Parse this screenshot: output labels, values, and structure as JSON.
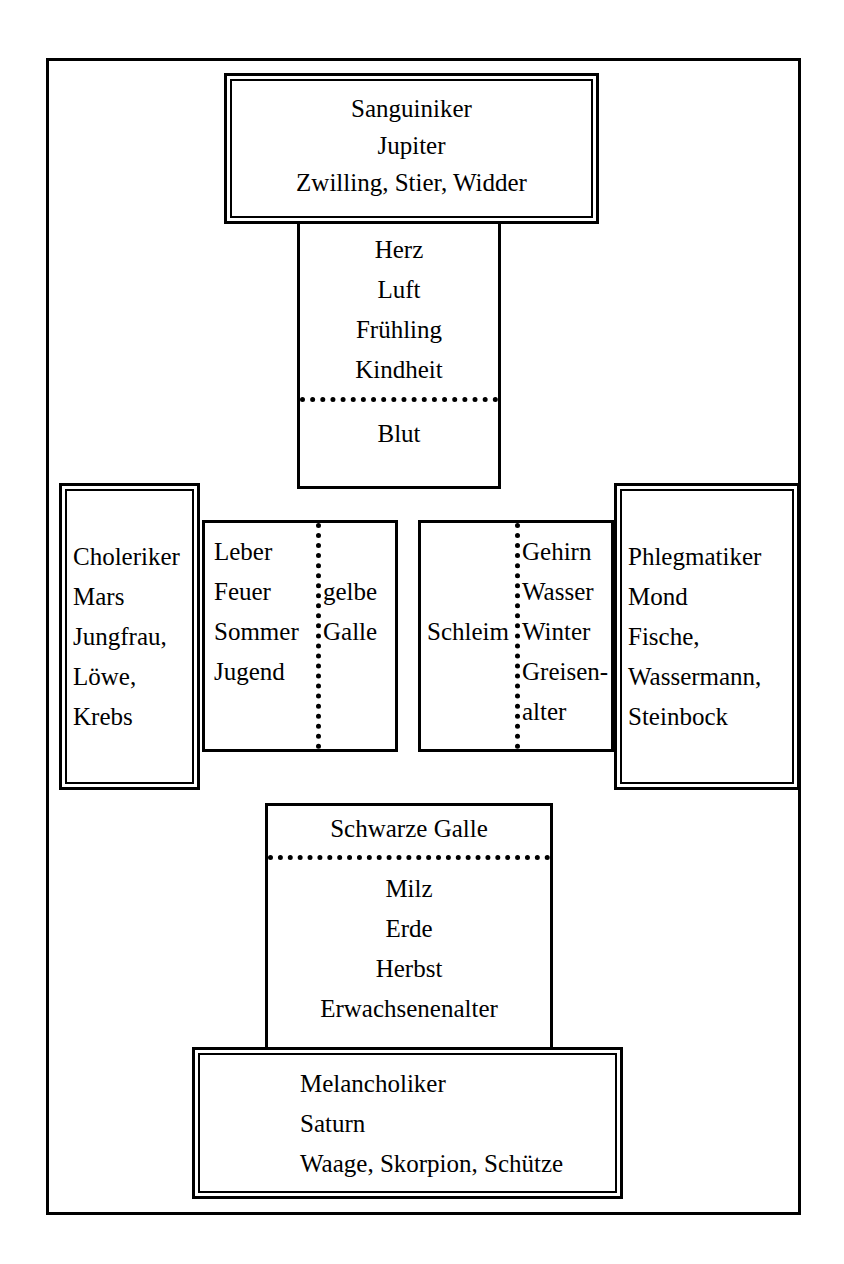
{
  "diagram": {
    "type": "four-temperaments-humoral-diagram",
    "language": "de"
  },
  "nodes": {
    "sanguiniker": {
      "temperament": "Sanguiniker",
      "planet": "Jupiter",
      "signs": "Zwilling, Stier, Widder"
    },
    "sanguiniker_attributes": {
      "organ": "Herz",
      "element": "Luft",
      "season": "Frühling",
      "age": "Kindheit",
      "humor": "Blut"
    },
    "choleriker": {
      "temperament": "Choleriker",
      "planet": "Mars",
      "signs_line1": "Jungfrau,",
      "signs_line2": "Löwe,",
      "signs_line3": "Krebs"
    },
    "choleriker_attributes": {
      "organ": "Leber",
      "element": "Feuer",
      "season": "Sommer",
      "age": "Jugend",
      "humor_line1": "gelbe",
      "humor_line2": "Galle"
    },
    "phlegmatiker": {
      "temperament": "Phlegmatiker",
      "planet": "Mond",
      "signs_line1": "Fische,",
      "signs_line2": "Wassermann,",
      "signs_line3": "Steinbock"
    },
    "phlegmatiker_attributes": {
      "organ": "Gehirn",
      "element": "Wasser",
      "season": "Winter",
      "age_line1": "Greisen-",
      "age_line2": "alter",
      "humor": "Schleim"
    },
    "melancholiker": {
      "temperament": "Melancholiker",
      "planet": "Saturn",
      "signs": "Waage, Skorpion, Schütze"
    },
    "melancholiker_attributes": {
      "humor": "Schwarze Galle",
      "organ": "Milz",
      "element": "Erde",
      "season": "Herbst",
      "age": "Erwachsenenalter"
    }
  }
}
